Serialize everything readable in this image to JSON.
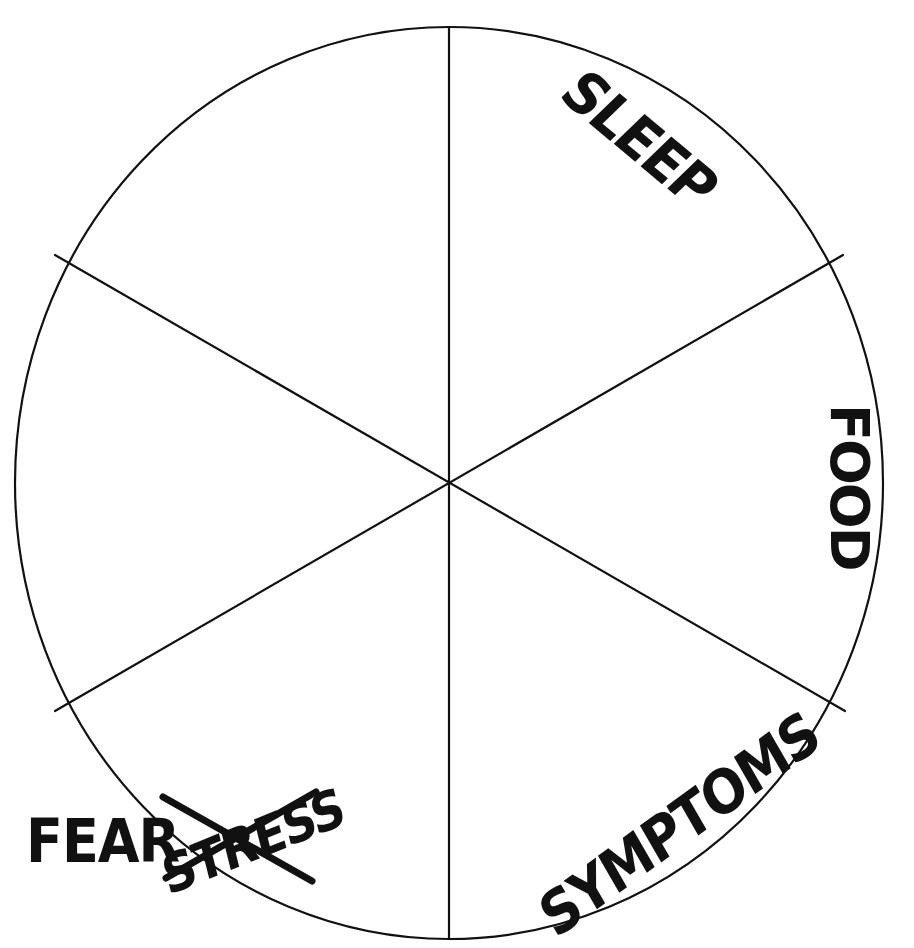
{
  "page": {
    "background_color": "#ffffff",
    "ink_color": "#111111",
    "width": 914,
    "height": 948
  },
  "diagram": {
    "type": "wheel",
    "shape": "circle",
    "segment_count": 6,
    "center": {
      "x": 449,
      "y": 483
    },
    "radius_x": 434,
    "radius_y": 456,
    "stroke_width": 2.2,
    "spokes": [
      {
        "name": "spoke-top",
        "angle_deg": -90,
        "endpoint": {
          "x": 449,
          "y": 27
        }
      },
      {
        "name": "spoke-upper-right",
        "angle_deg": -30,
        "endpoint": {
          "x": 843,
          "y": 255
        }
      },
      {
        "name": "spoke-lower-right",
        "angle_deg": 30,
        "endpoint": {
          "x": 845,
          "y": 711
        }
      },
      {
        "name": "spoke-bottom",
        "angle_deg": 90,
        "endpoint": {
          "x": 449,
          "y": 939
        }
      },
      {
        "name": "spoke-lower-left",
        "angle_deg": 150,
        "endpoint": {
          "x": 55,
          "y": 711
        }
      },
      {
        "name": "spoke-upper-left",
        "angle_deg": -150,
        "endpoint": {
          "x": 55,
          "y": 255
        }
      }
    ]
  },
  "labels": {
    "sleep": {
      "text": "SLEEP",
      "position": "upper-right-arc",
      "rotation_deg": 40,
      "inside_circle": true
    },
    "food": {
      "text": "FOOD",
      "position": "right-edge",
      "rotation_deg": 90,
      "inside_circle": true
    },
    "symptoms": {
      "text": "SYMPTOMS",
      "position": "lower-right-arc",
      "rotation_deg": -36,
      "inside_circle": true
    },
    "fear": {
      "text": "FEAR",
      "position": "outside-lower-left",
      "rotation_deg": 0,
      "inside_circle": false,
      "struck_through": false
    },
    "stress": {
      "text": "STRESS",
      "position": "outside-lower-left",
      "rotation_deg": -22,
      "inside_circle": false,
      "struck_through": true,
      "strike_style": "hand-drawn-x"
    }
  },
  "annotations": {
    "cross_out": {
      "name": "stress-cross-out",
      "target": "STRESS",
      "strokes": [
        {
          "x1": 163,
          "y1": 797,
          "x2": 312,
          "y2": 881
        },
        {
          "x1": 166,
          "y1": 878,
          "x2": 316,
          "y2": 792
        }
      ],
      "stroke_width": 7
    }
  }
}
